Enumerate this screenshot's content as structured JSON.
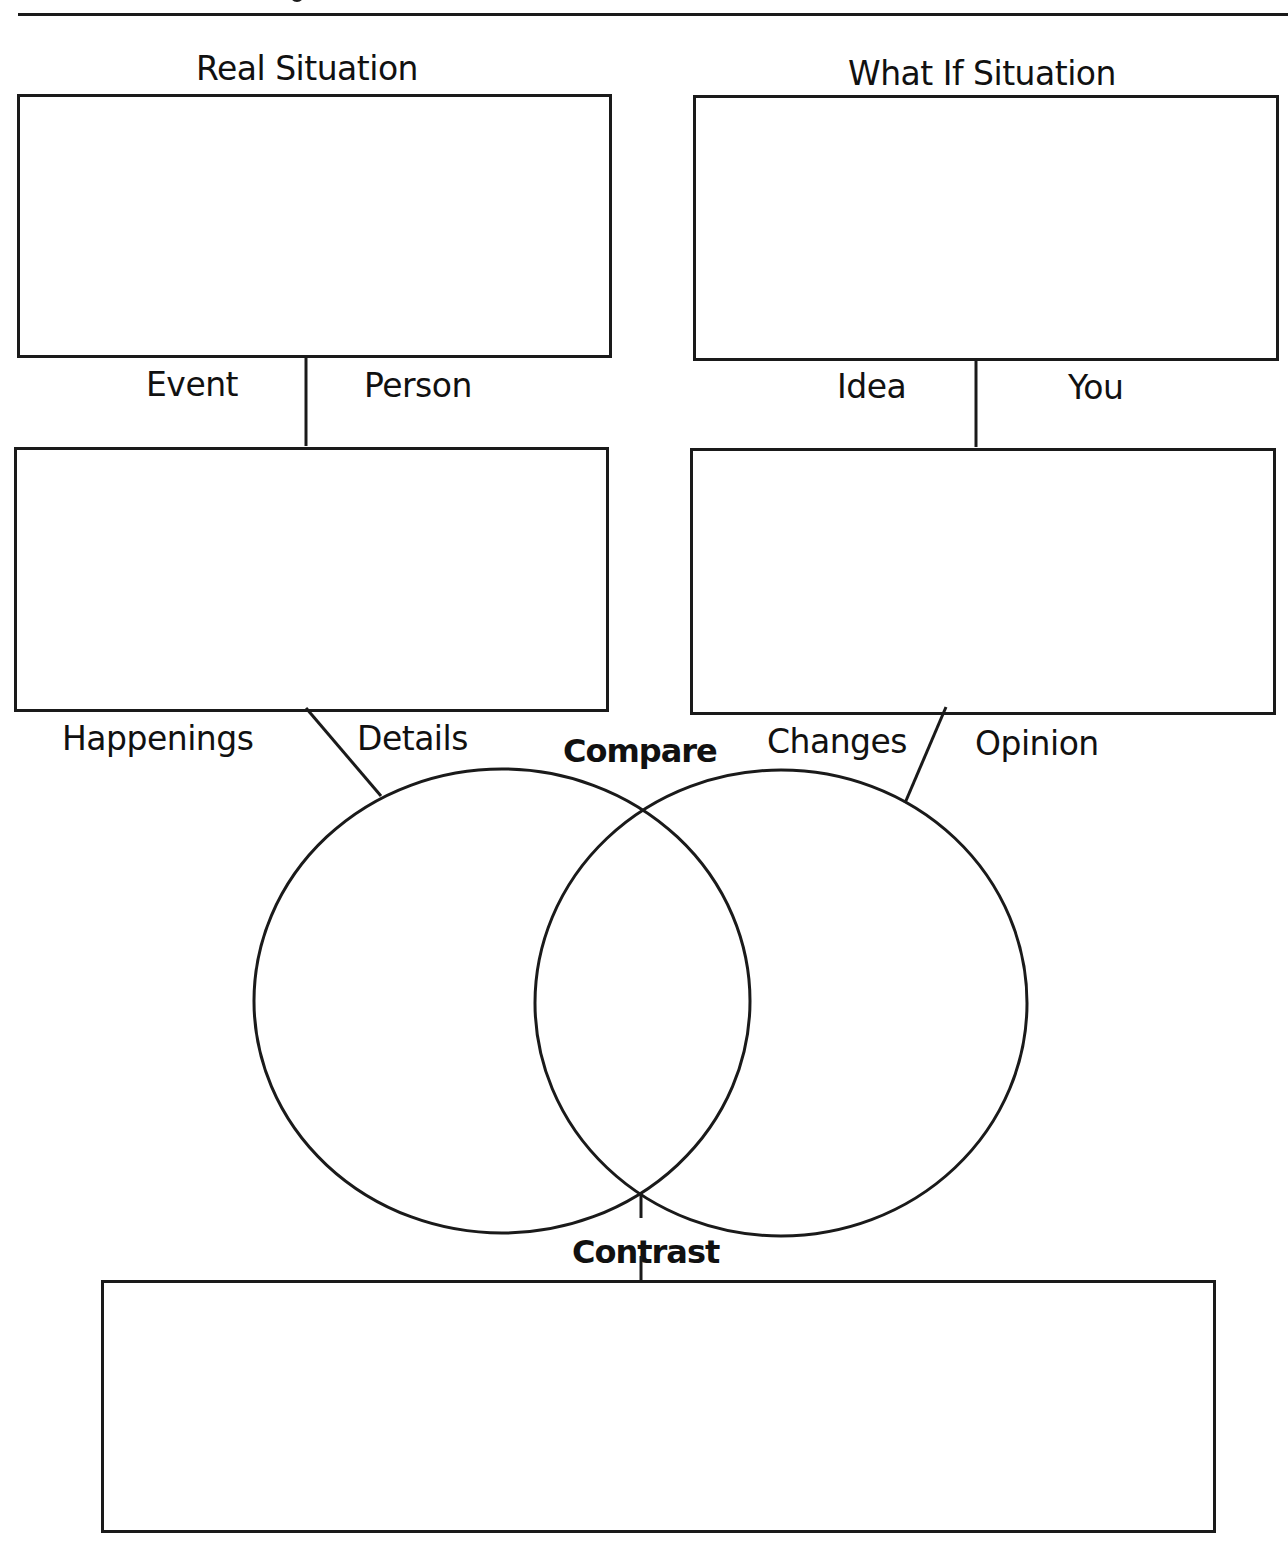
{
  "worksheet": {
    "headings": {
      "real_situation": "Real Situation",
      "what_if_situation": "What If Situation"
    },
    "left_connector_labels": {
      "left": "Event",
      "right": "Person"
    },
    "right_connector_labels": {
      "left": "Idea",
      "right": "You"
    },
    "lower_left_labels": {
      "left": "Happenings",
      "right": "Details"
    },
    "lower_right_labels": {
      "left": "Changes",
      "right": "Opinion"
    },
    "venn": {
      "top_label": "Compare",
      "bottom_label": "Contrast"
    },
    "colors": {
      "ink": "#1a1a1a",
      "paper": "#ffffff"
    }
  }
}
